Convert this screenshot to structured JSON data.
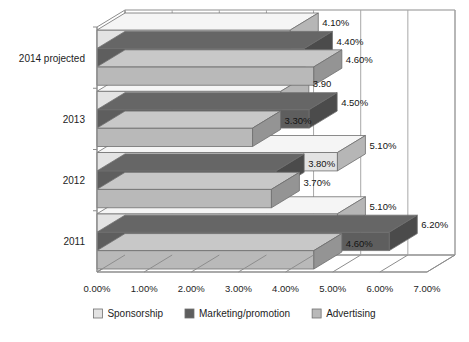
{
  "chart_data": {
    "type": "bar",
    "orientation": "horizontal",
    "style": "3d-clustered",
    "title": "",
    "subtitle": "",
    "xlabel": "",
    "ylabel": "",
    "xlim": [
      0,
      7
    ],
    "xtick_labels": [
      "0.00%",
      "1.00%",
      "2.00%",
      "3.00%",
      "4.00%",
      "5.00%",
      "6.00%",
      "7.00%"
    ],
    "xtick_values": [
      0,
      1,
      2,
      3,
      4,
      5,
      6,
      7
    ],
    "grid": true,
    "legend_position": "bottom",
    "categories": [
      "2011",
      "2012",
      "2013",
      "2014 projected"
    ],
    "series": [
      {
        "name": "Sponsorship",
        "color": "#e3e3e3",
        "values": [
          5.1,
          5.1,
          3.9,
          4.1
        ],
        "labels": [
          "5.10%",
          "5.10%",
          "3.90",
          "4.10%"
        ]
      },
      {
        "name": "Marketing/promotion",
        "color": "#5e5e5e",
        "values": [
          6.2,
          3.8,
          4.5,
          4.4
        ],
        "labels": [
          "6.20%",
          "3.80%",
          "4.50%",
          "4.40%"
        ]
      },
      {
        "name": "Advertising",
        "color": "#b9b9b9",
        "values": [
          4.6,
          3.7,
          3.3,
          4.6
        ],
        "labels": [
          "4.60%",
          "3.70%",
          "3.30%",
          "4.60%"
        ]
      }
    ]
  },
  "legend": {
    "items": [
      {
        "label": "Sponsorship",
        "swatch": "#e3e3e3"
      },
      {
        "label": "Marketing/promotion",
        "swatch": "#5e5e5e"
      },
      {
        "label": "Advertising",
        "swatch": "#b9b9b9"
      }
    ]
  },
  "colors": {
    "background": "#ffffff",
    "frame": "#8d8d8d",
    "grid": "#a8a8a8",
    "text": "#1d1d1d",
    "bar_edge": "#6f6f6f"
  }
}
